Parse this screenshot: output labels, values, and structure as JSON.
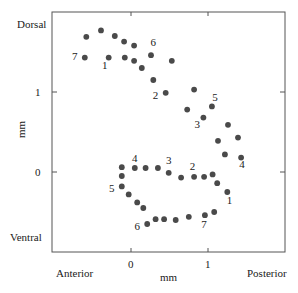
{
  "chart_data": {
    "type": "scatter",
    "title": "",
    "xlabel": "mm",
    "ylabel": "mm",
    "x_direction_labels": {
      "left": "Anterior",
      "right": "Posterior"
    },
    "y_direction_labels": {
      "top": "Dorsal",
      "bottom": "Ventral"
    },
    "x_ticks": [
      "0",
      "1"
    ],
    "y_ticks": [
      "1",
      "0"
    ],
    "xlim": [
      -1.02,
      2.0
    ],
    "ylim": [
      -1.0,
      2.0
    ],
    "grid": false,
    "legend": null,
    "series": [
      {
        "name": "upper",
        "points": [
          [
            -0.58,
            1.69
          ],
          [
            -0.39,
            1.77
          ],
          [
            -0.21,
            1.7
          ],
          [
            -0.09,
            1.63
          ],
          [
            0.04,
            1.58
          ],
          [
            -0.6,
            1.43
          ],
          [
            -0.29,
            1.43
          ],
          [
            -0.08,
            1.43
          ],
          [
            0.04,
            1.39
          ],
          [
            0.14,
            1.3
          ],
          [
            0.26,
            1.46
          ],
          [
            0.53,
            1.39
          ],
          [
            0.29,
            1.15
          ],
          [
            0.45,
            0.99
          ],
          [
            0.82,
            1.03
          ],
          [
            0.73,
            0.78
          ],
          [
            1.05,
            0.82
          ],
          [
            0.94,
            0.68
          ],
          [
            1.26,
            0.59
          ],
          [
            1.13,
            0.39
          ],
          [
            1.39,
            0.43
          ],
          [
            1.22,
            0.22
          ],
          [
            1.43,
            0.18
          ]
        ],
        "labels": [
          {
            "text": "7",
            "x": -0.73,
            "y": 1.4
          },
          {
            "text": "1",
            "x": -0.34,
            "y": 1.29
          },
          {
            "text": "6",
            "x": 0.29,
            "y": 1.57
          },
          {
            "text": "2",
            "x": 0.32,
            "y": 0.91
          },
          {
            "text": "5",
            "x": 1.09,
            "y": 0.89
          },
          {
            "text": "3",
            "x": 0.86,
            "y": 0.55
          },
          {
            "text": "4",
            "x": 1.44,
            "y": 0.05
          }
        ]
      },
      {
        "name": "lower",
        "points": [
          [
            -0.12,
            0.06
          ],
          [
            0.05,
            0.05
          ],
          [
            0.19,
            0.05
          ],
          [
            0.35,
            0.05
          ],
          [
            0.49,
            -0.01
          ],
          [
            0.65,
            -0.07
          ],
          [
            0.82,
            -0.06
          ],
          [
            0.95,
            -0.06
          ],
          [
            1.06,
            -0.03
          ],
          [
            1.12,
            -0.14
          ],
          [
            1.25,
            -0.25
          ],
          [
            1.08,
            -0.5
          ],
          [
            0.96,
            -0.54
          ],
          [
            0.75,
            -0.56
          ],
          [
            0.58,
            -0.6
          ],
          [
            0.43,
            -0.59
          ],
          [
            0.32,
            -0.59
          ],
          [
            0.21,
            -0.65
          ],
          [
            0.16,
            -0.45
          ],
          [
            0.08,
            -0.38
          ],
          [
            -0.03,
            -0.28
          ],
          [
            -0.12,
            -0.18
          ],
          [
            -0.12,
            -0.05
          ]
        ],
        "labels": [
          {
            "text": "4",
            "x": 0.05,
            "y": 0.13
          },
          {
            "text": "3",
            "x": 0.49,
            "y": 0.1
          },
          {
            "text": "2",
            "x": 0.8,
            "y": 0.02
          },
          {
            "text": "5",
            "x": -0.25,
            "y": -0.25
          },
          {
            "text": "1",
            "x": 1.28,
            "y": -0.4
          },
          {
            "text": "6",
            "x": 0.08,
            "y": -0.72
          },
          {
            "text": "7",
            "x": 0.95,
            "y": -0.7
          }
        ]
      }
    ]
  },
  "labels": {
    "dorsal": "Dorsal",
    "ventral": "Ventral",
    "anterior": "Anterior",
    "posterior": "Posterior",
    "xlabel": "mm",
    "ylabel": "mm",
    "xtick0": "0",
    "xtick1": "1",
    "ytick1": "1",
    "ytick0": "0"
  },
  "style": {
    "dot_color": "#4a4a4a",
    "axis_color": "#555555",
    "text_color": "#1a1a1a"
  }
}
